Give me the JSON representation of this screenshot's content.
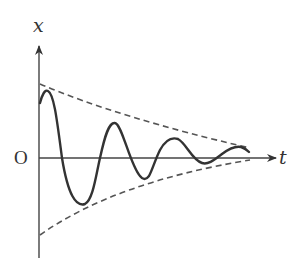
{
  "diagram": {
    "labels": {
      "vertical_axis": "x",
      "horizontal_axis": "t",
      "origin": "O"
    },
    "colors": {
      "axis": "#444444",
      "curve": "#333333",
      "envelope": "#555555",
      "background": "#ffffff"
    },
    "axes": {
      "origin": [
        39,
        158
      ],
      "x_axis_end": [
        276,
        158
      ],
      "y_axis_top": [
        39,
        46
      ],
      "y_axis_bottom": [
        39,
        258
      ]
    },
    "envelope_upper": "M40,84 Q120,118 250,148",
    "envelope_lower": "M40,235 Q115,182 250,160",
    "curve_path": "M40,103 C42,95 45,89 48,91 C54,94 57,120 62,158 C68,195 76,207 85,204 C93,200 96,175 100,158 C105,135 109,122 115,123 C122,124 130,165 140,176 C143,180 146,180 149,176 C152,171 155,160 160,150 C166,139 172,137 178,139 C186,143 192,160 202,163 C208,165 214,160 222,154 C230,148 236,146 241,147 C245,148 247,150 249,152"
  }
}
